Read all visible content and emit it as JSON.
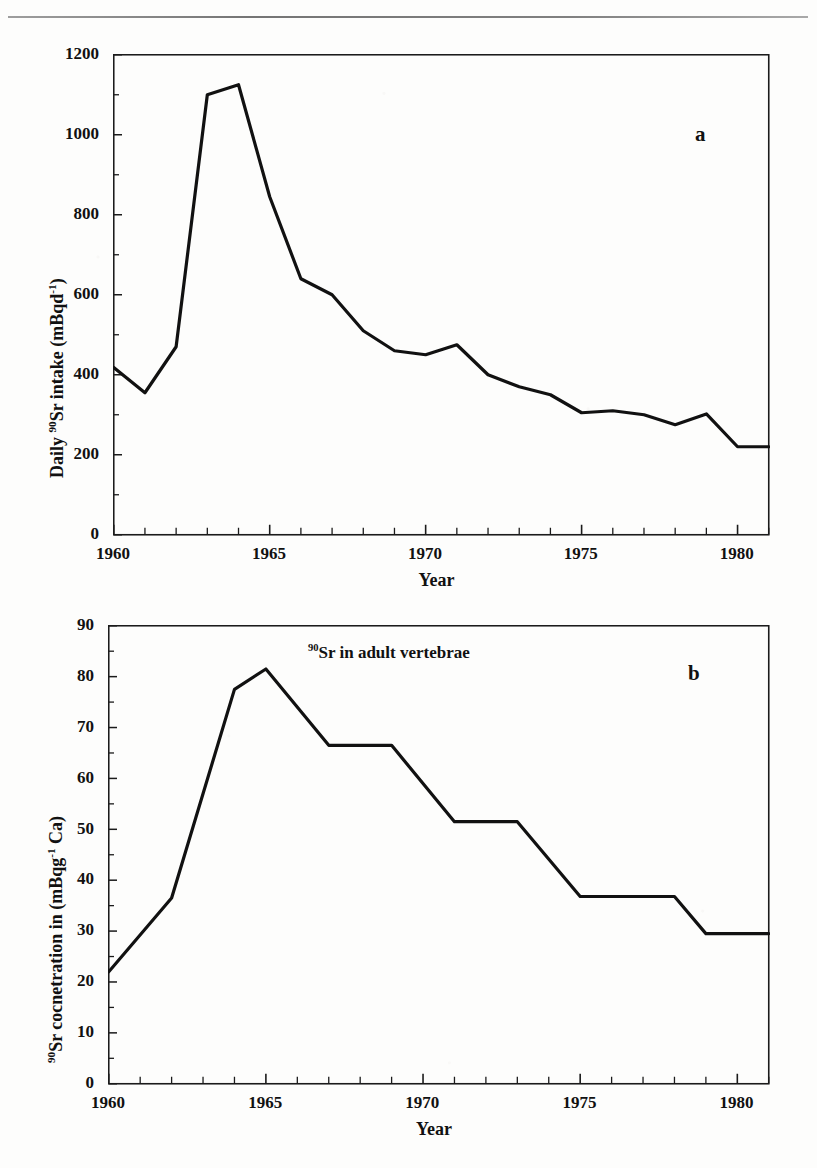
{
  "document": {
    "top_rule": "horizontal-rule"
  },
  "figures": [
    {
      "panel_label": "a",
      "y_axis_title_prefix": "Daily ",
      "y_axis_title_sup": "90",
      "y_axis_title_mid": "Sr intake (mBqd",
      "y_axis_title_sup2": "-1",
      "y_axis_title_suffix": ")",
      "x_axis_title": "Year",
      "annotation": ""
    },
    {
      "panel_label": "b",
      "y_axis_title_prefix": "",
      "y_axis_title_sup": "90",
      "y_axis_title_mid": "Sr cocnetration in  (mBqg",
      "y_axis_title_sup2": "-1",
      "y_axis_title_suffix": " Ca)",
      "x_axis_title": "Year",
      "annotation_sup": "90",
      "annotation_text": "Sr in adult vertebrae"
    }
  ],
  "chart_data": [
    {
      "type": "line",
      "title": "",
      "panel": "a",
      "xlabel": "Year",
      "ylabel": "Daily 90Sr intake (mBqd-1)",
      "xlim": [
        1960,
        1981
      ],
      "ylim": [
        0,
        1200
      ],
      "ytick_values": [
        0,
        200,
        400,
        600,
        800,
        1000,
        1200
      ],
      "ytick_labels": [
        "0",
        "200",
        "400",
        "600",
        "800",
        "1000",
        "1200"
      ],
      "xtick_values": [
        1960,
        1965,
        1970,
        1975,
        1980
      ],
      "xtick_labels": [
        "1960",
        "1965",
        "1970",
        "1975",
        "1980"
      ],
      "minor_x_ticks": true,
      "minor_y_ticks": true,
      "grid": false,
      "legend": "none",
      "line_color": "#111111",
      "x": [
        1960,
        1961,
        1962,
        1963,
        1964,
        1965,
        1966,
        1967,
        1968,
        1969,
        1970,
        1971,
        1972,
        1973,
        1974,
        1975,
        1976,
        1977,
        1978,
        1979,
        1980,
        1981
      ],
      "values": [
        418,
        355,
        470,
        1100,
        1125,
        845,
        640,
        600,
        510,
        460,
        450,
        475,
        400,
        370,
        350,
        305,
        310,
        300,
        275,
        302,
        220,
        220
      ]
    },
    {
      "type": "line",
      "title": "",
      "panel": "b",
      "xlabel": "Year",
      "ylabel": "90Sr cocnetration in (mBqg-1 Ca)",
      "annotation": "90Sr in adult vertebrae",
      "xlim": [
        1960,
        1981
      ],
      "ylim": [
        0,
        90
      ],
      "ytick_values": [
        0,
        10,
        20,
        30,
        40,
        50,
        60,
        70,
        80,
        90
      ],
      "ytick_labels": [
        "0",
        "10",
        "20",
        "30",
        "40",
        "50",
        "60",
        "70",
        "80",
        "90"
      ],
      "xtick_values": [
        1960,
        1965,
        1970,
        1975,
        1980
      ],
      "xtick_labels": [
        "1960",
        "1965",
        "1970",
        "1975",
        "1980"
      ],
      "minor_x_ticks": true,
      "minor_y_ticks": true,
      "grid": false,
      "legend": "none",
      "line_color": "#111111",
      "x": [
        1960,
        1962,
        1964,
        1965,
        1967,
        1969,
        1971,
        1973,
        1975,
        1978,
        1979,
        1981
      ],
      "values": [
        22,
        36.5,
        77.5,
        81.5,
        66.5,
        66.5,
        51.5,
        51.5,
        36.8,
        36.8,
        29.5,
        29.5
      ]
    }
  ]
}
